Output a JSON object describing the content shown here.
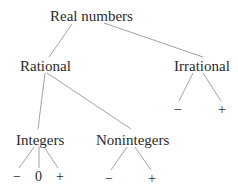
{
  "tree": {
    "root": {
      "label": "Real numbers"
    },
    "rational": {
      "label": "Rational"
    },
    "irrational": {
      "label": "Irrational",
      "children": [
        "−",
        "+"
      ]
    },
    "integers": {
      "label": "Integers",
      "children": [
        "−",
        "0",
        "+"
      ]
    },
    "nonintegers": {
      "label": "Nonintegers",
      "children": [
        "−",
        "+"
      ]
    }
  },
  "colors": {
    "text": "#2a2a2a",
    "edge": "#8a8a8a",
    "background": "#ffffff"
  }
}
